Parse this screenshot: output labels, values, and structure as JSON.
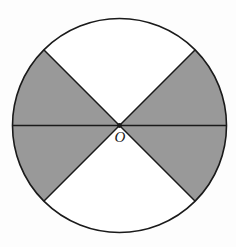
{
  "figure": {
    "type": "geometry-diagram",
    "background_color": "#fdfdfd",
    "circle": {
      "name": "circle-outline",
      "center_x": 119.5,
      "center_y": 125.5,
      "radius": 107,
      "stroke_color": "#1a1a1a",
      "stroke_width": 1.6,
      "fill_color": "#ffffff"
    },
    "center_point": {
      "name": "center-point-O",
      "label": "O",
      "x": 119.5,
      "y": 125.5,
      "label_x": 120,
      "label_y": 142,
      "dot_radius": 2.4,
      "dot_color": "#1a1a1a"
    },
    "colors": {
      "shaded": "#999999",
      "unshaded": "#ffffff",
      "stroke": "#1a1a1a",
      "background": "#fdfdfd"
    },
    "sectors": [
      {
        "name": "sector-upper-right",
        "start_angle_deg": 0,
        "end_angle_deg": 45,
        "shaded": true,
        "fill": "#999999"
      },
      {
        "name": "sector-top",
        "start_angle_deg": 45,
        "end_angle_deg": 135,
        "shaded": false,
        "fill": "#ffffff"
      },
      {
        "name": "sector-upper-left",
        "start_angle_deg": 135,
        "end_angle_deg": 180,
        "shaded": true,
        "fill": "#999999"
      },
      {
        "name": "sector-lower-left",
        "start_angle_deg": 180,
        "end_angle_deg": 225,
        "shaded": true,
        "fill": "#999999"
      },
      {
        "name": "sector-bottom",
        "start_angle_deg": 225,
        "end_angle_deg": 315,
        "shaded": false,
        "fill": "#ffffff"
      },
      {
        "name": "sector-lower-right",
        "start_angle_deg": 315,
        "end_angle_deg": 360,
        "shaded": true,
        "fill": "#999999"
      }
    ],
    "lines": [
      {
        "name": "horizontal-diameter",
        "x1": 12.5,
        "y1": 125.5,
        "x2": 226.5,
        "y2": 125.5
      },
      {
        "name": "diagonal-nw-se",
        "x1": 43.8,
        "y1": 49.8,
        "x2": 195.2,
        "y2": 201.2
      },
      {
        "name": "diagonal-ne-sw",
        "x1": 195.2,
        "y1": 49.8,
        "x2": 43.8,
        "y2": 201.2
      }
    ]
  }
}
